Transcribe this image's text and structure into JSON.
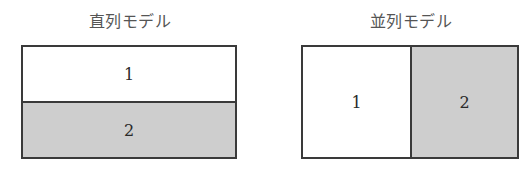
{
  "serial_model": {
    "title": "直列モデル",
    "cells": [
      {
        "label": "1",
        "shaded": false
      },
      {
        "label": "2",
        "shaded": true
      }
    ],
    "layout": "vertical"
  },
  "parallel_model": {
    "title": "並列モデル",
    "cells": [
      {
        "label": "1",
        "shaded": false
      },
      {
        "label": "2",
        "shaded": true
      }
    ],
    "layout": "horizontal"
  },
  "colors": {
    "border": "#3a3a3a",
    "shade": "#d6d6d6",
    "background": "#ffffff",
    "title_text": "#555555"
  }
}
